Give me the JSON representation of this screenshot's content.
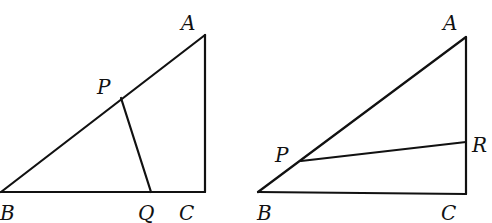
{
  "figures": [
    {
      "id": "left",
      "points": {
        "A": {
          "label": "A",
          "x": 205,
          "y": 35,
          "lx": 181,
          "ly": 30
        },
        "B": {
          "label": "B",
          "x": 1,
          "y": 192,
          "lx": 0,
          "ly": 220
        },
        "C": {
          "label": "C",
          "x": 205,
          "y": 192,
          "lx": 179,
          "ly": 220
        },
        "P": {
          "label": "P",
          "x": 121,
          "y": 98,
          "lx": 97,
          "ly": 94
        },
        "Q": {
          "label": "Q",
          "x": 151,
          "y": 192,
          "lx": 138,
          "ly": 220
        }
      },
      "segments": [
        [
          "A",
          "B"
        ],
        [
          "B",
          "C"
        ],
        [
          "C",
          "A"
        ],
        [
          "P",
          "Q"
        ]
      ]
    },
    {
      "id": "right",
      "points": {
        "A": {
          "label": "A",
          "x": 466,
          "y": 37,
          "lx": 443,
          "ly": 30
        },
        "B": {
          "label": "B",
          "x": 258,
          "y": 192,
          "lx": 257,
          "ly": 220
        },
        "C": {
          "label": "C",
          "x": 466,
          "y": 194,
          "lx": 441,
          "ly": 220
        },
        "P": {
          "label": "P",
          "x": 301,
          "y": 161,
          "lx": 275,
          "ly": 162
        },
        "R": {
          "label": "R",
          "x": 466,
          "y": 142,
          "lx": 472,
          "ly": 152
        }
      },
      "segments": [
        [
          "A",
          "B"
        ],
        [
          "B",
          "C"
        ],
        [
          "C",
          "A"
        ],
        [
          "P",
          "R"
        ]
      ]
    }
  ]
}
